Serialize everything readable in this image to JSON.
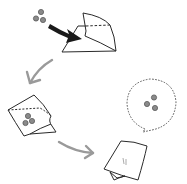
{
  "diagram": {
    "type": "process-illustration",
    "steps": [
      {
        "id": 1,
        "description": "Beads dropped into folded paper (black arrow)"
      },
      {
        "id": 2,
        "description": "Paper folded closed around beads"
      },
      {
        "id": 3,
        "description": "Packet folded flat"
      },
      {
        "id": 4,
        "description": "Thought bubble: beads hidden inside"
      }
    ],
    "colors": {
      "line": "#2a2a2a",
      "bead": "#8a8a8a",
      "bead_stroke": "#5a5a5a",
      "arrow_black": "#1a1a1a",
      "arrow_gray": "#9a9a9a",
      "dotted": "#555555",
      "background": "#ffffff"
    }
  }
}
